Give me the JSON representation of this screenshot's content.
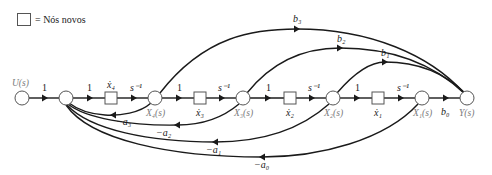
{
  "legend": {
    "symbol": "square-box",
    "text": "= Nós novos"
  },
  "nodes": {
    "input": "U(s)",
    "x4": "X₄(s)",
    "x3": "X₃(s)",
    "x2": "X₂(s)",
    "x1": "X₁(s)",
    "output": "Y(s)"
  },
  "new_nodes": {
    "xdot4": "ẋ₄",
    "xdot3": "ẋ₃",
    "xdot2": "ẋ₂",
    "xdot1": "ẋ₁"
  },
  "forward_gains": {
    "u_to_n1": "1",
    "n1_to_xd4": "1",
    "xd4_to_x4": "s⁻¹",
    "x4_to_xd3": "1",
    "xd3_to_x3": "s⁻¹",
    "x3_to_xd2": "1",
    "xd2_to_x2": "s⁻¹",
    "x2_to_xd1": "1",
    "xd1_to_x1": "s⁻¹",
    "x1_to_y": "b₀"
  },
  "feedforward_gains": {
    "b3": "b₃",
    "b2": "b₂",
    "b1": "b₁"
  },
  "feedback_gains": {
    "a3": "−a₃",
    "a2": "−a₂",
    "a1": "−a₁",
    "a0": "−a₀"
  }
}
